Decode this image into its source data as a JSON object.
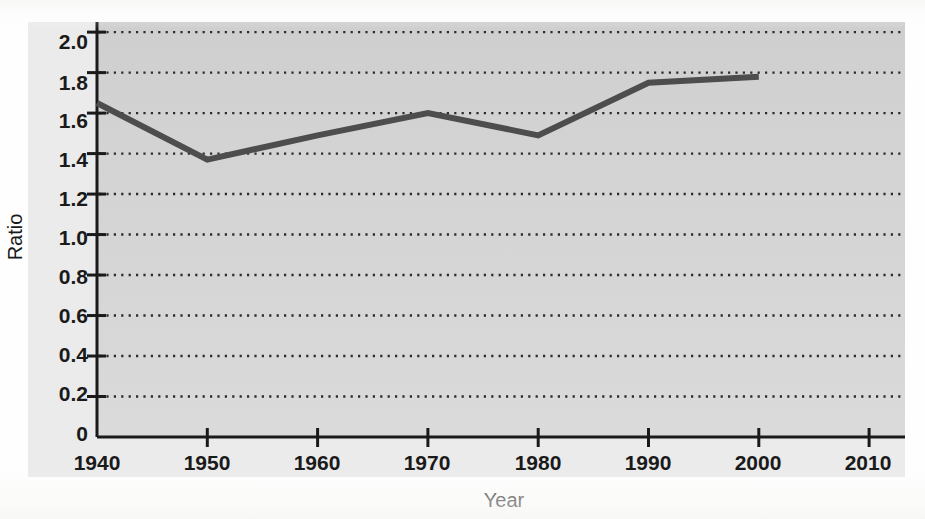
{
  "chart_data": {
    "type": "line",
    "title": "",
    "xlabel": "Year",
    "ylabel": "Ratio",
    "x": [
      1940,
      1950,
      1960,
      1970,
      1980,
      1990,
      2000
    ],
    "values": [
      1.65,
      1.37,
      1.49,
      1.6,
      1.49,
      1.75,
      1.78
    ],
    "series": [
      {
        "name": "Ratio",
        "values": [
          1.65,
          1.37,
          1.49,
          1.6,
          1.49,
          1.75,
          1.78
        ]
      }
    ],
    "xlim": [
      1940,
      2013
    ],
    "ylim": [
      0,
      2.05
    ],
    "xticks": [
      1940,
      1950,
      1960,
      1970,
      1980,
      1990,
      2000,
      2010
    ],
    "xtick_labels": [
      "1940",
      "1950",
      "1960",
      "1970",
      "1980",
      "1990",
      "2000",
      "2010"
    ],
    "yticks": [
      0,
      0.2,
      0.4,
      0.6,
      0.8,
      1.0,
      1.2,
      1.4,
      1.6,
      1.8,
      2.0
    ],
    "ytick_labels": [
      "0",
      "0.2",
      "0.4",
      "0.6",
      "0.8",
      "1.0",
      "1.2",
      "1.4",
      "1.6",
      "1.8",
      "2.0"
    ],
    "grid": "horizontal-dotted",
    "legend": "none",
    "colors": {
      "line": "#4d4d4d",
      "plot_background": "#d4d4d4",
      "axis": "#1a1a1a",
      "gridline": "#2b2b2b",
      "label_band": "#ebebeb"
    },
    "line_width_px": 6
  },
  "axes": {
    "y_title": "Ratio",
    "x_title": "Year",
    "y_labels": {
      "t0": "0",
      "t1": "0.2",
      "t2": "0.4",
      "t3": "0.6",
      "t4": "0.8",
      "t5": "1.0",
      "t6": "1.2",
      "t7": "1.4",
      "t8": "1.6",
      "t9": "1.8",
      "t10": "2.0"
    },
    "x_labels": {
      "t0": "1940",
      "t1": "1950",
      "t2": "1960",
      "t3": "1970",
      "t4": "1980",
      "t5": "1990",
      "t6": "2000",
      "t7": "2010"
    }
  }
}
